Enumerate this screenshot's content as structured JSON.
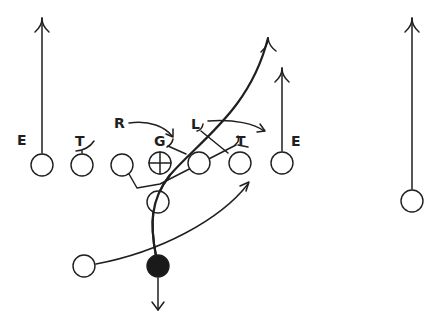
{
  "diagram": {
    "type": "football-play",
    "colors": {
      "ink": "#1f1f1f",
      "background": "#ffffff",
      "ball_carrier_fill": "#1a1a1a"
    },
    "labels": {
      "left_end": "E",
      "left_tackle": "T",
      "right_label_r": "R",
      "guard": "G",
      "pull_label_l": "L",
      "right_tackle": "T",
      "right_end": "E"
    },
    "players": [
      {
        "id": "left-end",
        "x": 42,
        "y": 165,
        "type": "open"
      },
      {
        "id": "left-tackle",
        "x": 82,
        "y": 165,
        "type": "open"
      },
      {
        "id": "left-guard",
        "x": 122,
        "y": 165,
        "type": "open"
      },
      {
        "id": "center",
        "x": 160,
        "y": 163,
        "type": "crosshair"
      },
      {
        "id": "right-guard",
        "x": 199,
        "y": 163,
        "type": "open"
      },
      {
        "id": "right-tackle",
        "x": 240,
        "y": 163,
        "type": "open"
      },
      {
        "id": "right-end",
        "x": 282,
        "y": 163,
        "type": "open"
      },
      {
        "id": "flanker",
        "x": 412,
        "y": 201,
        "type": "open"
      },
      {
        "id": "fullback",
        "x": 158,
        "y": 202,
        "type": "open"
      },
      {
        "id": "halfback",
        "x": 84,
        "y": 266,
        "type": "open"
      },
      {
        "id": "quarterback",
        "x": 158,
        "y": 266,
        "type": "filled"
      }
    ]
  }
}
